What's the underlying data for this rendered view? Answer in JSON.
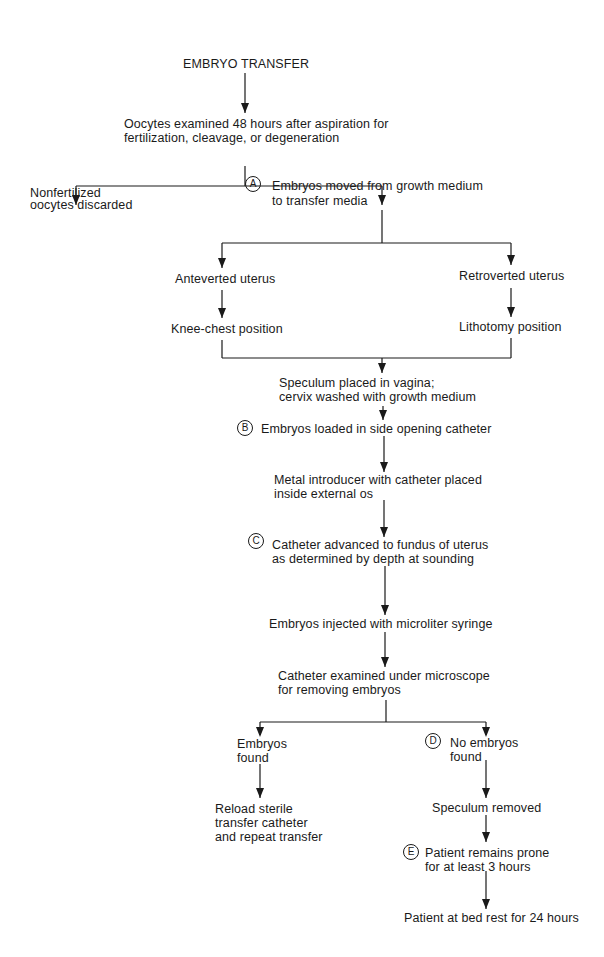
{
  "title": "EMBRYO TRANSFER",
  "nodes": {
    "examine": [
      "Oocytes examined 48 hours after aspiration for",
      "fertilization, cleavage, or degeneration"
    ],
    "discard": [
      "Nonfertilized",
      "oocytes discarded"
    ],
    "move": [
      "Embryos moved from growth medium",
      "to transfer media"
    ],
    "antev": [
      "Anteverted uterus"
    ],
    "retro": [
      "Retroverted uterus"
    ],
    "knee": [
      "Knee-chest position"
    ],
    "litho": [
      "Lithotomy position"
    ],
    "speculum": [
      "Speculum placed in vagina;",
      "cervix washed with growth medium"
    ],
    "load": [
      "Embryos loaded in side opening catheter"
    ],
    "introducer": [
      "Metal introducer with catheter placed",
      "inside external os"
    ],
    "advance": [
      "Catheter advanced to fundus of uterus",
      "as determined by depth at sounding"
    ],
    "inject": [
      "Embryos injected with microliter syringe"
    ],
    "check": [
      "Catheter examined under microscope",
      "for removing embryos"
    ],
    "found": [
      "Embryos",
      "found"
    ],
    "notfound": [
      "No embryos",
      "found"
    ],
    "reload": [
      "Reload sterile",
      "transfer catheter",
      "and repeat transfer"
    ],
    "specremoved": [
      "Speculum removed"
    ],
    "prone": [
      "Patient remains prone",
      "for at least 3 hours"
    ],
    "bedrest": [
      "Patient at bed rest for 24 hours"
    ]
  },
  "badges": {
    "a": "A",
    "b": "B",
    "c": "C",
    "d": "D",
    "e": "E"
  }
}
